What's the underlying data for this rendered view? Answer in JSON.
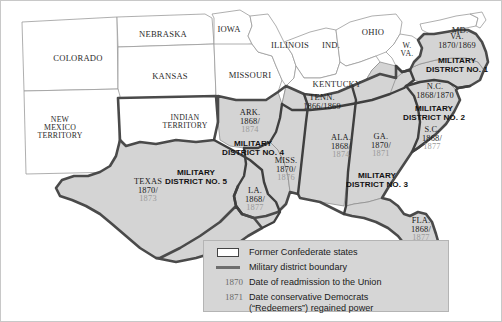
{
  "map": {
    "title": "Reconstruction Military Districts of the Former Confederate States",
    "colors": {
      "confederate_fill": "#d4d4d4",
      "union_fill": "#ffffff",
      "state_border": "#8a8a8a",
      "district_boundary": "#3a3a3a",
      "legend_background": "#d6d6d6",
      "readmission_date": "#1a1a1a",
      "redeemer_date": "#9a9a9a"
    },
    "union_labels": [
      {
        "id": "colorado",
        "name": "COLORADO",
        "x": 78,
        "y": 58,
        "lines": [
          "COLORADO"
        ]
      },
      {
        "id": "nebraska",
        "name": "NEBRASKA",
        "x": 163,
        "y": 34,
        "lines": [
          "NEBRASKA"
        ]
      },
      {
        "id": "kansas",
        "name": "KANSAS",
        "x": 170,
        "y": 76,
        "lines": [
          "KANSAS"
        ]
      },
      {
        "id": "iowa",
        "name": "IOWA",
        "x": 229,
        "y": 29,
        "lines": [
          "IOWA"
        ]
      },
      {
        "id": "missouri",
        "name": "MISSOURI",
        "x": 250,
        "y": 75,
        "lines": [
          "MISSOURI"
        ]
      },
      {
        "id": "illinois",
        "name": "ILLINOIS",
        "x": 290,
        "y": 45,
        "lines": [
          "ILLINOIS"
        ]
      },
      {
        "id": "indiana",
        "name": "IND.",
        "x": 331,
        "y": 45,
        "lines": [
          "IND."
        ]
      },
      {
        "id": "ohio",
        "name": "OHIO",
        "x": 373,
        "y": 32,
        "lines": [
          "OHIO"
        ]
      },
      {
        "id": "kentucky",
        "name": "KENTUCKY",
        "x": 337,
        "y": 84,
        "lines": [
          "KENTUCKY"
        ]
      },
      {
        "id": "west-virginia",
        "name": "W. VA.",
        "x": 407,
        "y": 50,
        "lines": [
          "W.",
          "VA."
        ]
      },
      {
        "id": "maryland",
        "name": "MD.",
        "x": 460,
        "y": 30,
        "lines": [
          "MD."
        ]
      },
      {
        "id": "new-mexico-territory",
        "name": "NEW MEXICO TERRITORY",
        "x": 60,
        "y": 128,
        "lines": [
          "NEW",
          "MEXICO",
          "TERRITORY"
        ]
      },
      {
        "id": "indian-territory",
        "name": "INDIAN TERRITORY",
        "x": 185,
        "y": 122,
        "lines": [
          "INDIAN",
          "TERRITORY"
        ]
      }
    ],
    "confederate_states": [
      {
        "id": "arkansas",
        "abbr": "ARK.",
        "x": 250,
        "y": 122,
        "readmission": "1868/",
        "redeemed": "1874"
      },
      {
        "id": "tennessee",
        "abbr": "TENN.",
        "x": 322,
        "y": 103,
        "readmission": "1866/1869",
        "redeemed": "",
        "inline": true
      },
      {
        "id": "virginia",
        "abbr": "VA.",
        "x": 457,
        "y": 42,
        "readmission": "1870/1869",
        "redeemed": "",
        "inline": true
      },
      {
        "id": "north-carolina",
        "abbr": "N.C.",
        "x": 435,
        "y": 92,
        "readmission": "1868/1870",
        "redeemed": "",
        "inline": true
      },
      {
        "id": "south-carolina",
        "abbr": "S.C.",
        "x": 432,
        "y": 139,
        "readmission": "1868/",
        "redeemed": "1877"
      },
      {
        "id": "georgia",
        "abbr": "GA.",
        "x": 381,
        "y": 146,
        "readmission": "1870/",
        "redeemed": "1871"
      },
      {
        "id": "alabama",
        "abbr": "ALA.",
        "x": 341,
        "y": 147,
        "readmission": "1868/",
        "redeemed": "1874"
      },
      {
        "id": "mississippi",
        "abbr": "MISS.",
        "x": 286,
        "y": 170,
        "readmission": "1870/",
        "redeemed": "1876"
      },
      {
        "id": "louisiana",
        "abbr": "LA.",
        "x": 255,
        "y": 200,
        "readmission": "1868/",
        "redeemed": "1877"
      },
      {
        "id": "texas",
        "abbr": "TEXAS",
        "x": 148,
        "y": 191,
        "readmission": "1870/",
        "redeemed": "1873"
      },
      {
        "id": "florida",
        "abbr": "FLA.",
        "x": 421,
        "y": 230,
        "readmission": "1868/",
        "redeemed": "1877"
      }
    ],
    "military_districts": [
      {
        "id": "district-1",
        "x": 457,
        "y": 66,
        "lines": [
          "MILITARY",
          "DISTRICT NO. 1"
        ]
      },
      {
        "id": "district-2",
        "x": 434,
        "y": 114,
        "lines": [
          "MILITARY",
          "DISTRICT NO. 2"
        ]
      },
      {
        "id": "district-3",
        "x": 377,
        "y": 181,
        "lines": [
          "MILITARY",
          "DISTRICT NO. 3"
        ]
      },
      {
        "id": "district-4",
        "x": 253,
        "y": 149,
        "lines": [
          "MILITARY",
          "DISTRICT NO. 4"
        ]
      },
      {
        "id": "district-5",
        "x": 196,
        "y": 178,
        "lines": [
          "MILITARY",
          "DISTRICT NO. 5"
        ]
      }
    ]
  },
  "legend": {
    "rows": [
      {
        "id": "former-confederate-states",
        "key": "swatch",
        "year": "",
        "text": [
          "Former Confederate states"
        ]
      },
      {
        "id": "military-district-boundary",
        "key": "line",
        "year": "",
        "text": [
          "Military district boundary"
        ]
      },
      {
        "id": "readmission-date",
        "key": "year",
        "year": "1870",
        "text": [
          "Date of readmission to the Union"
        ]
      },
      {
        "id": "redeemer-date",
        "key": "year",
        "year": "1871",
        "text": [
          "Date conservative Democrats",
          "(“Redeemers”) regained power"
        ]
      }
    ]
  }
}
